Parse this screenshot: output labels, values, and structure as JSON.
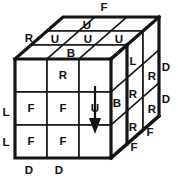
{
  "figure": {
    "colors": {
      "ink": "#141414",
      "paper": "#ffffff"
    }
  },
  "front_face": {
    "name": "front-face",
    "rows": [
      [
        "",
        "R",
        ""
      ],
      [
        "F",
        "F",
        "U"
      ],
      [
        "F",
        "F",
        ""
      ]
    ]
  },
  "top_face": {
    "name": "top-face",
    "rows": [
      [
        "",
        "U",
        ""
      ],
      [
        "U",
        "U",
        "U"
      ],
      [
        "",
        "B",
        ""
      ]
    ]
  },
  "right_face": {
    "name": "right-face",
    "rows": [
      [
        "L",
        "R"
      ],
      [
        "R",
        "R"
      ],
      [
        "R",
        ""
      ]
    ],
    "inner_labels": [
      "B"
    ]
  },
  "edge_labels": [
    {
      "id": "top-f",
      "text": "F"
    },
    {
      "id": "upper-left-r",
      "text": "R"
    },
    {
      "id": "right-d-upper",
      "text": "D"
    },
    {
      "id": "right-d-lower",
      "text": "D"
    },
    {
      "id": "left-l-upper",
      "text": "L"
    },
    {
      "id": "left-l-lower",
      "text": "L"
    },
    {
      "id": "bottom-d-left",
      "text": "D"
    },
    {
      "id": "bottom-d-right",
      "text": "D"
    },
    {
      "id": "lower-right-f-upper",
      "text": "F"
    },
    {
      "id": "lower-right-f-lower",
      "text": "F"
    }
  ],
  "arrow": {
    "name": "down-turn-arrow",
    "direction": "down",
    "column": "front-right"
  }
}
